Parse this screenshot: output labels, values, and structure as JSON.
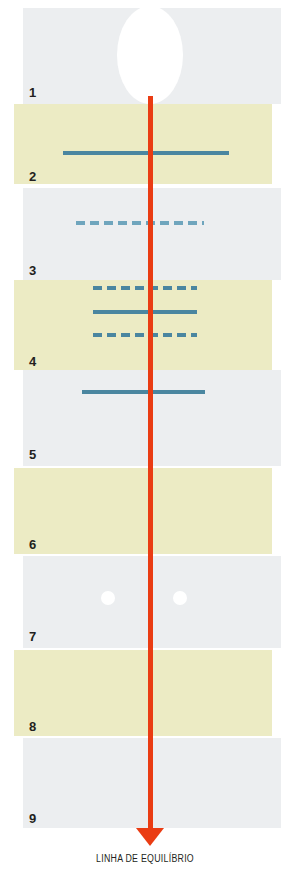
{
  "figure": {
    "caption": "LINHA DE EQUILÍBRIO",
    "equilibrium_line_color": "#ea3c13",
    "marker_color": "#4a86a0",
    "band_grey_color": "#eceef0",
    "band_yellow_color": "#ecebc4"
  },
  "bands": [
    {
      "label": "1",
      "tone": "grey",
      "x": 23,
      "y": 8,
      "width": 258,
      "height": 96,
      "label_x": 29,
      "label_y": 86
    },
    {
      "label": "2",
      "tone": "yellow",
      "x": 14,
      "y": 104,
      "width": 258,
      "height": 80,
      "label_x": 29,
      "label_y": 170
    },
    {
      "label": "3",
      "tone": "grey",
      "x": 23,
      "y": 188,
      "width": 258,
      "height": 92,
      "label_x": 29,
      "label_y": 264
    },
    {
      "label": "4",
      "tone": "yellow",
      "x": 14,
      "y": 280,
      "width": 258,
      "height": 90,
      "label_x": 29,
      "label_y": 355
    },
    {
      "label": "5",
      "tone": "grey",
      "x": 23,
      "y": 370,
      "width": 258,
      "height": 96,
      "label_x": 29,
      "label_y": 448
    },
    {
      "label": "6",
      "tone": "yellow",
      "x": 14,
      "y": 468,
      "width": 258,
      "height": 86,
      "label_x": 29,
      "label_y": 538
    },
    {
      "label": "7",
      "tone": "grey",
      "x": 23,
      "y": 556,
      "width": 258,
      "height": 92,
      "label_x": 29,
      "label_y": 630
    },
    {
      "label": "8",
      "tone": "yellow",
      "x": 14,
      "y": 650,
      "width": 258,
      "height": 86,
      "label_x": 29,
      "label_y": 720
    },
    {
      "label": "9",
      "tone": "grey",
      "x": 23,
      "y": 738,
      "width": 258,
      "height": 90,
      "label_x": 29,
      "label_y": 812
    }
  ],
  "markers": [
    {
      "style": "solid",
      "x": 63,
      "y": 151,
      "width": 166,
      "band": "2"
    },
    {
      "style": "dashed-light",
      "x": 76,
      "y": 221,
      "width": 128,
      "band": "3"
    },
    {
      "style": "dashed",
      "x": 93,
      "y": 286,
      "width": 104,
      "band": "4"
    },
    {
      "style": "solid",
      "x": 93,
      "y": 310,
      "width": 104,
      "band": "4"
    },
    {
      "style": "dashed",
      "x": 93,
      "y": 333,
      "width": 104,
      "band": "4"
    },
    {
      "style": "solid",
      "x": 82,
      "y": 390,
      "width": 123,
      "band": "5"
    }
  ],
  "dots": [
    {
      "x": 101,
      "y": 591,
      "size": 14,
      "band": "7"
    },
    {
      "x": 173,
      "y": 591,
      "size": 14,
      "band": "7"
    }
  ]
}
